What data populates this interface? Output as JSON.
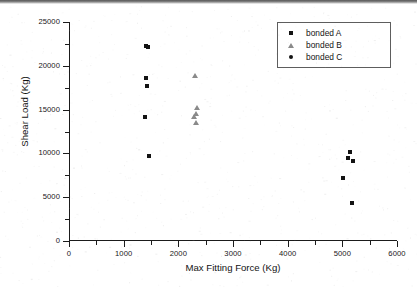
{
  "chart_data": {
    "type": "scatter",
    "title": "",
    "xlabel": "Max Fitting Force (Kg)",
    "ylabel": "Shear Load (Kg)",
    "xlim": [
      0,
      6000
    ],
    "ylim": [
      0,
      25000
    ],
    "xticks": [
      0,
      1000,
      2000,
      3000,
      4000,
      5000,
      6000
    ],
    "yticks": [
      0,
      5000,
      10000,
      15000,
      20000,
      25000
    ],
    "xtick_labels": [
      "0",
      "1000",
      "2000",
      "3000",
      "4000",
      "5000",
      "6000"
    ],
    "ytick_labels": [
      "0",
      "5000",
      "10000",
      "15000",
      "20000",
      "25000"
    ],
    "minor_ticks": true,
    "grid": false,
    "legend_position": "top-right",
    "series": [
      {
        "name": "bonded A",
        "marker": "square",
        "color": "#131313",
        "points": [
          {
            "x": 1400,
            "y": 22250
          },
          {
            "x": 1440,
            "y": 22150
          },
          {
            "x": 1400,
            "y": 18600
          },
          {
            "x": 1430,
            "y": 17700
          },
          {
            "x": 1390,
            "y": 14100
          },
          {
            "x": 1470,
            "y": 9700
          },
          {
            "x": 5140,
            "y": 10150
          },
          {
            "x": 5110,
            "y": 9500
          },
          {
            "x": 5190,
            "y": 9150
          },
          {
            "x": 5010,
            "y": 7200
          },
          {
            "x": 5170,
            "y": 4350
          }
        ]
      },
      {
        "name": "bonded B",
        "marker": "triangle",
        "color": "#8a8a8a",
        "points": [
          {
            "x": 2300,
            "y": 18800
          },
          {
            "x": 2350,
            "y": 15200
          },
          {
            "x": 2330,
            "y": 14500
          },
          {
            "x": 2290,
            "y": 14100
          },
          {
            "x": 2320,
            "y": 13500
          }
        ]
      },
      {
        "name": "bonded C",
        "marker": "circle",
        "color": "#131313",
        "points": []
      }
    ]
  },
  "legend": {
    "entries": [
      {
        "label": "bonded A",
        "marker": "square"
      },
      {
        "label": "bonded B",
        "marker": "triangle"
      },
      {
        "label": "bonded C",
        "marker": "circle"
      }
    ]
  }
}
